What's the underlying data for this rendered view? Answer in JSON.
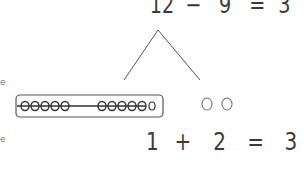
{
  "top_equation": {
    "operand_a": "12",
    "operator": "−",
    "operand_b": "9",
    "equals": "=",
    "result": "3"
  },
  "bottom_equation": {
    "operand_a": "1",
    "operator": "+",
    "operand_b": "2",
    "equals": "=",
    "result": "3"
  },
  "number_bond": {
    "whole": "12",
    "left_part": "10 (boxed) + 1",
    "right_part": "2"
  },
  "boxed_group": {
    "crossed_circles": 10,
    "group_sizes": [
      5,
      5
    ],
    "uncrossed_circles": 1
  },
  "loose_circles": {
    "count": 2
  },
  "left_edge_fragments": [
    "e",
    "e"
  ],
  "colors": {
    "ink": "#3a3a3a",
    "background": "#ffffff"
  }
}
